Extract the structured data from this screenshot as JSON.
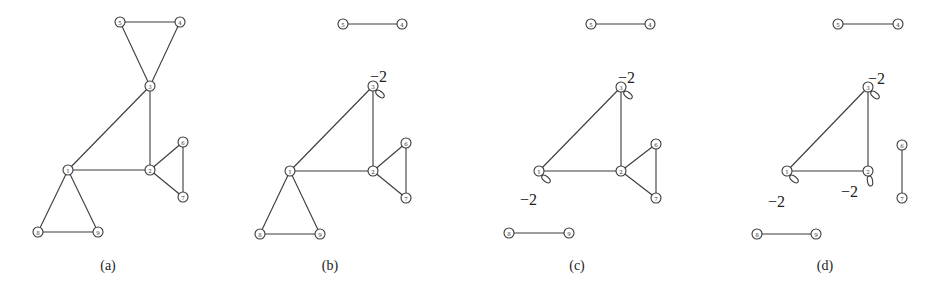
{
  "figure": {
    "panels": [
      {
        "id": "a",
        "caption": "(a)",
        "caption_pos": [
          108,
          270
        ],
        "nodes": [
          {
            "id": "5",
            "x": 120,
            "y": 22
          },
          {
            "id": "4",
            "x": 180,
            "y": 22
          },
          {
            "id": "3",
            "x": 150,
            "y": 86
          },
          {
            "id": "6",
            "x": 183,
            "y": 142
          },
          {
            "id": "1",
            "x": 68,
            "y": 170
          },
          {
            "id": "2",
            "x": 150,
            "y": 170
          },
          {
            "id": "7",
            "x": 183,
            "y": 197
          },
          {
            "id": "8",
            "x": 38,
            "y": 232
          },
          {
            "id": "9",
            "x": 98,
            "y": 232
          }
        ],
        "edges": [
          [
            "5",
            "4"
          ],
          [
            "5",
            "3"
          ],
          [
            "4",
            "3"
          ],
          [
            "3",
            "1"
          ],
          [
            "3",
            "2"
          ],
          [
            "1",
            "2"
          ],
          [
            "2",
            "6"
          ],
          [
            "2",
            "7"
          ],
          [
            "6",
            "7"
          ],
          [
            "1",
            "8"
          ],
          [
            "1",
            "9"
          ],
          [
            "8",
            "9"
          ]
        ],
        "loops": []
      },
      {
        "id": "b",
        "caption": "(b)",
        "caption_pos": [
          330,
          270
        ],
        "nodes": [
          {
            "id": "5",
            "x": 343,
            "y": 24
          },
          {
            "id": "4",
            "x": 402,
            "y": 24
          },
          {
            "id": "3",
            "x": 373,
            "y": 86
          },
          {
            "id": "6",
            "x": 406,
            "y": 143
          },
          {
            "id": "1",
            "x": 290,
            "y": 171
          },
          {
            "id": "2",
            "x": 373,
            "y": 171
          },
          {
            "id": "7",
            "x": 406,
            "y": 198
          },
          {
            "id": "8",
            "x": 260,
            "y": 234
          },
          {
            "id": "9",
            "x": 320,
            "y": 234
          }
        ],
        "edges": [
          [
            "5",
            "4"
          ],
          [
            "3",
            "1"
          ],
          [
            "3",
            "2"
          ],
          [
            "1",
            "2"
          ],
          [
            "2",
            "6"
          ],
          [
            "2",
            "7"
          ],
          [
            "6",
            "7"
          ],
          [
            "1",
            "8"
          ],
          [
            "1",
            "9"
          ],
          [
            "8",
            "9"
          ]
        ],
        "loops": [
          {
            "node": "3",
            "dir": "down-right",
            "label": "−2",
            "label_pos": [
              370,
              77
            ]
          }
        ]
      },
      {
        "id": "c",
        "caption": "(c)",
        "caption_pos": [
          577,
          270
        ],
        "nodes": [
          {
            "id": "5",
            "x": 591,
            "y": 24
          },
          {
            "id": "4",
            "x": 650,
            "y": 24
          },
          {
            "id": "3",
            "x": 621,
            "y": 87
          },
          {
            "id": "6",
            "x": 656,
            "y": 144
          },
          {
            "id": "1",
            "x": 539,
            "y": 171
          },
          {
            "id": "2",
            "x": 621,
            "y": 171
          },
          {
            "id": "7",
            "x": 656,
            "y": 198
          },
          {
            "id": "8",
            "x": 509,
            "y": 233
          },
          {
            "id": "9",
            "x": 569,
            "y": 233
          }
        ],
        "edges": [
          [
            "5",
            "4"
          ],
          [
            "3",
            "1"
          ],
          [
            "3",
            "2"
          ],
          [
            "1",
            "2"
          ],
          [
            "2",
            "6"
          ],
          [
            "2",
            "7"
          ],
          [
            "6",
            "7"
          ],
          [
            "8",
            "9"
          ]
        ],
        "loops": [
          {
            "node": "3",
            "dir": "down-right",
            "label": "−2",
            "label_pos": [
              618,
              78
            ]
          },
          {
            "node": "1",
            "dir": "down-right",
            "label": "−2",
            "label_pos": [
              520,
              200
            ]
          }
        ]
      },
      {
        "id": "d",
        "caption": "(d)",
        "caption_pos": [
          825,
          270
        ],
        "nodes": [
          {
            "id": "5",
            "x": 838,
            "y": 24
          },
          {
            "id": "4",
            "x": 898,
            "y": 24
          },
          {
            "id": "3",
            "x": 868,
            "y": 87
          },
          {
            "id": "6",
            "x": 902,
            "y": 145
          },
          {
            "id": "1",
            "x": 787,
            "y": 171
          },
          {
            "id": "2",
            "x": 868,
            "y": 171
          },
          {
            "id": "7",
            "x": 902,
            "y": 198
          },
          {
            "id": "8",
            "x": 757,
            "y": 234
          },
          {
            "id": "9",
            "x": 816,
            "y": 234
          }
        ],
        "edges": [
          [
            "5",
            "4"
          ],
          [
            "3",
            "1"
          ],
          [
            "3",
            "2"
          ],
          [
            "1",
            "2"
          ],
          [
            "6",
            "7"
          ],
          [
            "8",
            "9"
          ]
        ],
        "loops": [
          {
            "node": "3",
            "dir": "down-right",
            "label": "−2",
            "label_pos": [
              868,
              79
            ]
          },
          {
            "node": "1",
            "dir": "down-right",
            "label": "−2",
            "label_pos": [
              768,
              202
            ]
          },
          {
            "node": "2",
            "dir": "down",
            "label": "−2",
            "label_pos": [
              841,
              192
            ]
          }
        ]
      }
    ]
  }
}
